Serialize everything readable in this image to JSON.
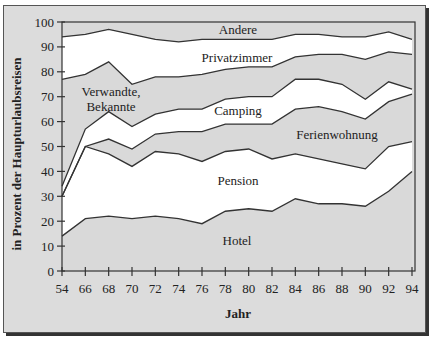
{
  "chart_data": {
    "type": "area",
    "stacked": true,
    "title": "",
    "xlabel": "Jahr",
    "ylabel": "in Prozent der Haupturlaubsreisen",
    "ylim": [
      0,
      100
    ],
    "yticks": [
      0,
      10,
      20,
      30,
      40,
      50,
      60,
      70,
      80,
      90,
      100
    ],
    "categories": [
      "54",
      "66",
      "68",
      "70",
      "72",
      "74",
      "76",
      "78",
      "80",
      "82",
      "84",
      "86",
      "88",
      "90",
      "92",
      "94"
    ],
    "grid": false,
    "legend": "inline band labels",
    "series": [
      {
        "name": "Hotel",
        "fill": "#d9d9d9",
        "values": [
          14,
          21,
          22,
          21,
          22,
          21,
          19,
          24,
          25,
          24,
          29,
          27,
          27,
          26,
          32,
          40
        ]
      },
      {
        "name": "Pension",
        "fill": "#ffffff",
        "values": [
          16,
          29,
          25,
          21,
          26,
          26,
          25,
          24,
          24,
          21,
          18,
          18,
          16,
          15,
          18,
          12
        ]
      },
      {
        "name": "Ferienwohnung",
        "fill": "#d9d9d9",
        "values": [
          0,
          0,
          6,
          7,
          7,
          9,
          12,
          11,
          10,
          14,
          18,
          21,
          21,
          20,
          18,
          19
        ]
      },
      {
        "name": "Camping",
        "fill": "#ffffff",
        "values": [
          4,
          7,
          11,
          9,
          8,
          9,
          9,
          10,
          11,
          11,
          12,
          11,
          11,
          8,
          8,
          2
        ]
      },
      {
        "name": "Verwandte, Bekannte",
        "fill": "#d9d9d9",
        "values": [
          43,
          22,
          20,
          17,
          15,
          13,
          14,
          12,
          12,
          12,
          9,
          10,
          12,
          16,
          12,
          14
        ]
      },
      {
        "name": "Privatzimmer",
        "fill": "#ffffff",
        "values": [
          17,
          16,
          13,
          20,
          15,
          14,
          14,
          12,
          11,
          11,
          9,
          8,
          7,
          9,
          8,
          6
        ]
      },
      {
        "name": "Andere",
        "fill": "#d9d9d9",
        "values": [
          6,
          5,
          3,
          5,
          7,
          8,
          7,
          7,
          7,
          7,
          5,
          5,
          6,
          6,
          4,
          7
        ]
      }
    ],
    "cumulative_tops": {
      "Hotel": [
        14,
        21,
        22,
        21,
        22,
        21,
        19,
        24,
        25,
        24,
        29,
        27,
        27,
        26,
        32,
        40
      ],
      "Pension": [
        30,
        50,
        47,
        42,
        48,
        47,
        44,
        48,
        49,
        45,
        47,
        45,
        43,
        41,
        50,
        52
      ],
      "Ferienwohnung": [
        30,
        50,
        53,
        49,
        55,
        56,
        56,
        59,
        59,
        59,
        65,
        66,
        64,
        61,
        68,
        71
      ],
      "Camping": [
        34,
        57,
        64,
        58,
        63,
        65,
        65,
        69,
        70,
        70,
        77,
        77,
        75,
        69,
        76,
        73
      ],
      "Verwandte, Bekannte": [
        77,
        79,
        84,
        75,
        78,
        78,
        79,
        81,
        82,
        82,
        86,
        87,
        87,
        85,
        88,
        87
      ],
      "Privatzimmer": [
        94,
        95,
        97,
        95,
        93,
        92,
        93,
        93,
        93,
        93,
        95,
        95,
        94,
        94,
        96,
        93
      ],
      "Andere": [
        100,
        100,
        100,
        100,
        100,
        100,
        100,
        100,
        100,
        100,
        100,
        100,
        100,
        100,
        100,
        100
      ]
    }
  },
  "labels": {
    "andere": "Andere",
    "privatzimmer": "Privatzimmer",
    "verwandte_1": "Verwandte,",
    "verwandte_2": "Bekannte",
    "camping": "Camping",
    "ferienwohnung": "Ferienwohnung",
    "pension": "Pension",
    "hotel": "Hotel",
    "xlabel": "Jahr",
    "ylabel": "in Prozent der Haupturlaubsreisen"
  },
  "colors": {
    "gray_fill": "#d9d9d9",
    "white_fill": "#ffffff",
    "line": "#333333",
    "frame_bg": "#dcdcdc"
  }
}
